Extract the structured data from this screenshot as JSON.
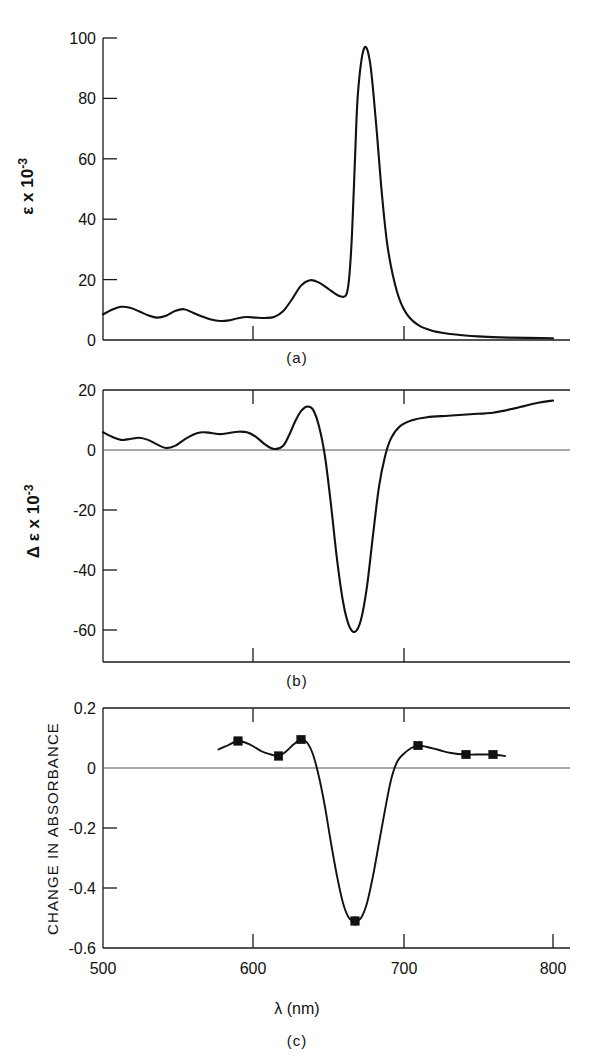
{
  "figure": {
    "panel_captions": [
      "(a)",
      "(b)",
      "(c)"
    ],
    "xaxis_label_lambda": "λ",
    "xaxis_label_units": "(nm)",
    "xaxis_label_full": "λ (nm)",
    "xtick_labels": [
      "500",
      "600",
      "700",
      "800"
    ],
    "xtick_values": [
      500,
      600,
      700,
      800
    ]
  },
  "chart_data": [
    {
      "type": "line",
      "panel": "(a)",
      "title": "",
      "xlabel": "λ (nm)",
      "ylabel": "ε x 10⁻³",
      "ylabel_base": "ε x 10",
      "ylabel_exponent": "-3",
      "xlim": [
        500,
        800
      ],
      "ylim": [
        0,
        100
      ],
      "yticks": [
        0,
        20,
        40,
        60,
        80,
        100
      ],
      "ytick_labels": [
        "0",
        "20",
        "40",
        "60",
        "80",
        "100"
      ],
      "xticks": [
        500,
        600,
        700,
        800
      ],
      "grid": false,
      "legend": "none",
      "series": [
        {
          "name": "absorption spectrum",
          "x": [
            500,
            506,
            512,
            518,
            524,
            530,
            536,
            542,
            548,
            554,
            560,
            566,
            572,
            578,
            584,
            590,
            596,
            602,
            608,
            614,
            620,
            626,
            632,
            638,
            644,
            650,
            654,
            658,
            662,
            664,
            666,
            668,
            670,
            674,
            678,
            682,
            686,
            690,
            696,
            702,
            710,
            720,
            735,
            750,
            770,
            800
          ],
          "y": [
            8.5,
            10.0,
            11.0,
            10.7,
            9.5,
            8.2,
            7.4,
            8.0,
            9.6,
            10.2,
            9.0,
            7.8,
            6.8,
            6.3,
            6.5,
            7.2,
            7.6,
            7.4,
            7.3,
            7.6,
            9.5,
            13.5,
            18.0,
            19.8,
            19.0,
            17.0,
            15.6,
            14.5,
            14.8,
            20.0,
            35.0,
            60.0,
            82.0,
            96.5,
            92.0,
            72.0,
            48.0,
            30.0,
            16.0,
            9.0,
            5.0,
            3.0,
            1.8,
            1.2,
            0.8,
            0.6
          ]
        }
      ]
    },
    {
      "type": "line",
      "panel": "(b)",
      "title": "",
      "xlabel": "λ (nm)",
      "ylabel": "Δε x 10⁻³",
      "ylabel_base": "Δ ε x 10",
      "ylabel_exponent": "-3",
      "xlim": [
        500,
        800
      ],
      "ylim": [
        -70,
        20
      ],
      "yticks": [
        20,
        0,
        -20,
        -40,
        -60
      ],
      "ytick_labels": [
        "20",
        "0",
        "-20",
        "-40",
        "-60"
      ],
      "xticks": [
        500,
        600,
        700,
        800
      ],
      "grid": false,
      "zero_line": true,
      "legend": "none",
      "series": [
        {
          "name": "circular dichroism difference spectrum",
          "x": [
            500,
            506,
            512,
            518,
            524,
            530,
            536,
            542,
            548,
            554,
            560,
            566,
            572,
            578,
            584,
            590,
            596,
            602,
            608,
            614,
            620,
            624,
            628,
            632,
            636,
            640,
            644,
            648,
            652,
            656,
            660,
            664,
            668,
            672,
            676,
            680,
            684,
            688,
            692,
            698,
            706,
            716,
            730,
            745,
            760,
            775,
            790,
            800
          ],
          "y": [
            6.0,
            4.5,
            3.5,
            3.8,
            4.2,
            3.5,
            2.0,
            0.8,
            1.5,
            3.5,
            5.2,
            6.0,
            5.8,
            5.4,
            5.8,
            6.2,
            6.0,
            4.5,
            2.0,
            0.5,
            1.5,
            5.0,
            9.5,
            13.0,
            14.5,
            13.5,
            8.0,
            -2.0,
            -18.0,
            -36.0,
            -50.0,
            -58.0,
            -60.0,
            -56.0,
            -45.0,
            -28.0,
            -12.0,
            -2.0,
            4.0,
            8.0,
            10.0,
            11.0,
            11.5,
            12.0,
            12.5,
            14.0,
            15.8,
            16.5
          ]
        }
      ]
    },
    {
      "type": "line",
      "panel": "(c)",
      "title": "",
      "xlabel": "λ (nm)",
      "ylabel": "CHANGE IN ABSORBANCE",
      "xlim": [
        500,
        800
      ],
      "ylim": [
        -0.6,
        0.2
      ],
      "yticks": [
        0.2,
        0,
        -0.2,
        -0.4,
        -0.6
      ],
      "ytick_labels": [
        "0.2",
        "0",
        "-0.2",
        "-0.4",
        "-0.6"
      ],
      "xticks": [
        500,
        600,
        700,
        800
      ],
      "grid": false,
      "zero_line": true,
      "legend": "none",
      "series": [
        {
          "name": "measured change in absorbance",
          "marker": "filled-square",
          "x": [
            590,
            617,
            632,
            668,
            710,
            742,
            760
          ],
          "y": [
            0.09,
            0.04,
            0.095,
            -0.51,
            0.075,
            0.045,
            0.045
          ],
          "yerr": [
            0.012,
            0.008,
            0.008,
            0.015,
            0.008,
            0.006,
            0.006
          ]
        },
        {
          "name": "fitted curve",
          "marker": "none",
          "x": [
            577,
            583,
            590,
            598,
            606,
            612,
            617,
            622,
            627,
            632,
            636,
            640,
            644,
            648,
            652,
            656,
            660,
            664,
            668,
            672,
            676,
            680,
            684,
            688,
            692,
            696,
            700,
            705,
            710,
            716,
            724,
            732,
            742,
            752,
            760,
            768
          ],
          "y": [
            0.062,
            0.075,
            0.09,
            0.078,
            0.055,
            0.045,
            0.04,
            0.055,
            0.078,
            0.095,
            0.085,
            0.045,
            -0.03,
            -0.13,
            -0.25,
            -0.36,
            -0.45,
            -0.5,
            -0.51,
            -0.5,
            -0.45,
            -0.36,
            -0.25,
            -0.14,
            -0.04,
            0.02,
            0.045,
            0.065,
            0.075,
            0.07,
            0.06,
            0.05,
            0.045,
            0.045,
            0.045,
            0.04
          ]
        }
      ]
    }
  ],
  "colors": {
    "curve": "#111111",
    "axis": "#1a1a1a",
    "zero_line": "#555555",
    "background": "#ffffff",
    "marker": "#111111"
  }
}
